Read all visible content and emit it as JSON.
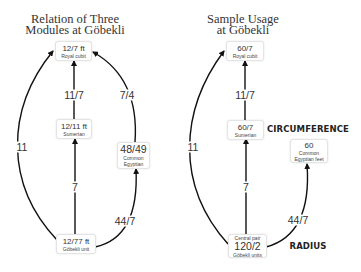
{
  "left_diagram": {
    "title_line1": "Relation of Three",
    "title_line2": "Modules at Göbekli",
    "nodes": {
      "royal_cubit": {
        "value": "12/7 ft",
        "label": "Royal cubit"
      },
      "sumerian": {
        "value": "12/11 ft",
        "label": "Sumerian"
      },
      "common_egyptian": {
        "value": "48/49",
        "label_line1": "Common",
        "label_line2": "Egyptian"
      },
      "gobekli_unit": {
        "value": "12/77 ft",
        "label": "Göbekli unit"
      }
    },
    "edge_labels": {
      "sumerian_to_royal": "11/7",
      "egyptian_to_royal": "7/4",
      "gobekli_to_royal": "11",
      "gobekli_to_sumerian": "7",
      "gobekli_to_egyptian": "44/7"
    }
  },
  "right_diagram": {
    "title_line1": "Sample Usage",
    "title_line2": "at Göbekli",
    "nodes": {
      "royal_cubit": {
        "value": "60/7",
        "label": "Royal cubit"
      },
      "sumerian": {
        "value": "60/7",
        "label": "Sumerian"
      },
      "egyptian_feet": {
        "value": "60",
        "label_line1": "Common",
        "label_line2": "Egyptian feet"
      },
      "central_pair": {
        "top_label": "Central pair",
        "value": "120/2",
        "label": "Göbekli units"
      }
    },
    "edge_labels": {
      "sumerian_to_royal": "11/7",
      "central_to_royal": "11",
      "central_to_sumerian": "7",
      "central_to_egyptian": "44/7"
    },
    "annotations": {
      "circumference": "CIRCUMFERENCE",
      "radius": "RADIUS"
    }
  },
  "colors": {
    "arrow": "#111111",
    "node_border": "#e4e4e4",
    "background": "#ffffff"
  }
}
